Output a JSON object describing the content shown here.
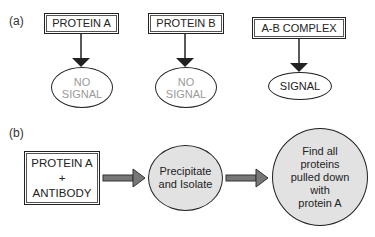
{
  "panel_a": {
    "label": "(a)",
    "columns": [
      {
        "box_label": "PROTEIN A",
        "result_line1": "NO",
        "result_line2": "SIGNAL"
      },
      {
        "box_label": "PROTEIN B",
        "result_line1": "NO",
        "result_line2": "SIGNAL"
      },
      {
        "box_label": "A-B COMPLEX",
        "result_line1": "SIGNAL"
      }
    ]
  },
  "panel_b": {
    "label": "(b)",
    "step1": {
      "line1": "PROTEIN A",
      "line2": "+",
      "line3": "ANTIBODY"
    },
    "step2": {
      "line1": "Precipitate",
      "line2": "and Isolate"
    },
    "step3": {
      "line1": "Find all",
      "line2": "proteins",
      "line3": "pulled down",
      "line4": "with",
      "line5": "protein A"
    }
  },
  "colors": {
    "stroke": "#222222",
    "no_signal_text": "#9a9a9a",
    "node_fill": "#e2e2e2",
    "arrow_fill": "#777777"
  }
}
